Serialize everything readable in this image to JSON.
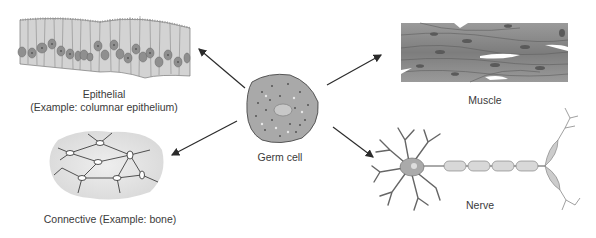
{
  "diagram": {
    "center": {
      "label": "Germ cell",
      "icon": "germ-cell-icon"
    },
    "tissues": [
      {
        "id": "epithelial",
        "line1": "Epithelial",
        "line2": "(Example: columnar epithelium)",
        "icon": "columnar-epithelium-icon"
      },
      {
        "id": "muscle",
        "line1": "Muscle",
        "icon": "muscle-tissue-icon"
      },
      {
        "id": "connective",
        "line1": "Connective (Example: bone)",
        "icon": "bone-connective-tissue-icon"
      },
      {
        "id": "nerve",
        "line1": "Nerve",
        "icon": "neuron-icon"
      }
    ],
    "arrows": [
      {
        "from": "Germ cell",
        "to": "Epithelial"
      },
      {
        "from": "Germ cell",
        "to": "Muscle"
      },
      {
        "from": "Germ cell",
        "to": "Connective"
      },
      {
        "from": "Germ cell",
        "to": "Nerve"
      }
    ],
    "colors": {
      "cell_fill": "#a9a9a9",
      "tissue_fill": "#d6d6d6",
      "arrow": "#2b2b2b",
      "muscle_fill": "#8c8c8c"
    }
  }
}
